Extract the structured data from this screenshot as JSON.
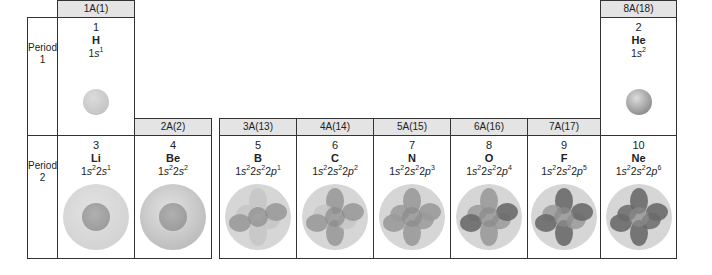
{
  "groups": [
    {
      "label": "1A(1)"
    },
    {
      "label": "2A(2)"
    },
    {
      "label": "3A(13)"
    },
    {
      "label": "4A(14)"
    },
    {
      "label": "5A(15)"
    },
    {
      "label": "6A(16)"
    },
    {
      "label": "7A(17)"
    },
    {
      "label": "8A(18)"
    }
  ],
  "periods": [
    {
      "label": "Period",
      "number": "1"
    },
    {
      "label": "Period",
      "number": "2"
    }
  ],
  "elements": [
    {
      "number": "1",
      "symbol": "H",
      "config": [
        [
          "1",
          "s",
          "1"
        ]
      ],
      "p_electrons": 0
    },
    {
      "number": "2",
      "symbol": "He",
      "config": [
        [
          "1",
          "s",
          "2"
        ]
      ],
      "p_electrons": 0
    },
    {
      "number": "3",
      "symbol": "Li",
      "config": [
        [
          "1",
          "s",
          "2"
        ],
        [
          "2",
          "s",
          "1"
        ]
      ],
      "p_electrons": 0
    },
    {
      "number": "4",
      "symbol": "Be",
      "config": [
        [
          "1",
          "s",
          "2"
        ],
        [
          "2",
          "s",
          "2"
        ]
      ],
      "p_electrons": 0
    },
    {
      "number": "5",
      "symbol": "B",
      "config": [
        [
          "1",
          "s",
          "2"
        ],
        [
          "2",
          "s",
          "2"
        ],
        [
          "2",
          "p",
          "1"
        ]
      ],
      "p_electrons": 1
    },
    {
      "number": "6",
      "symbol": "C",
      "config": [
        [
          "1",
          "s",
          "2"
        ],
        [
          "2",
          "s",
          "2"
        ],
        [
          "2",
          "p",
          "2"
        ]
      ],
      "p_electrons": 2
    },
    {
      "number": "7",
      "symbol": "N",
      "config": [
        [
          "1",
          "s",
          "2"
        ],
        [
          "2",
          "s",
          "2"
        ],
        [
          "2",
          "p",
          "3"
        ]
      ],
      "p_electrons": 3
    },
    {
      "number": "8",
      "symbol": "O",
      "config": [
        [
          "1",
          "s",
          "2"
        ],
        [
          "2",
          "s",
          "2"
        ],
        [
          "2",
          "p",
          "4"
        ]
      ],
      "p_electrons": 4
    },
    {
      "number": "9",
      "symbol": "F",
      "config": [
        [
          "1",
          "s",
          "2"
        ],
        [
          "2",
          "s",
          "2"
        ],
        [
          "2",
          "p",
          "5"
        ]
      ],
      "p_electrons": 5
    },
    {
      "number": "10",
      "symbol": "Ne",
      "config": [
        [
          "1",
          "s",
          "2"
        ],
        [
          "2",
          "s",
          "2"
        ],
        [
          "2",
          "p",
          "6"
        ]
      ],
      "p_electrons": 6
    }
  ],
  "colors": {
    "header_bg": "#e4e4e4",
    "border": "#333333",
    "outer_sphere": "#d3d3d3",
    "inner_sphere": "#9c9c9c",
    "lobe_light": "#b4b4b4",
    "lobe_dark": "#6e6e6e"
  }
}
